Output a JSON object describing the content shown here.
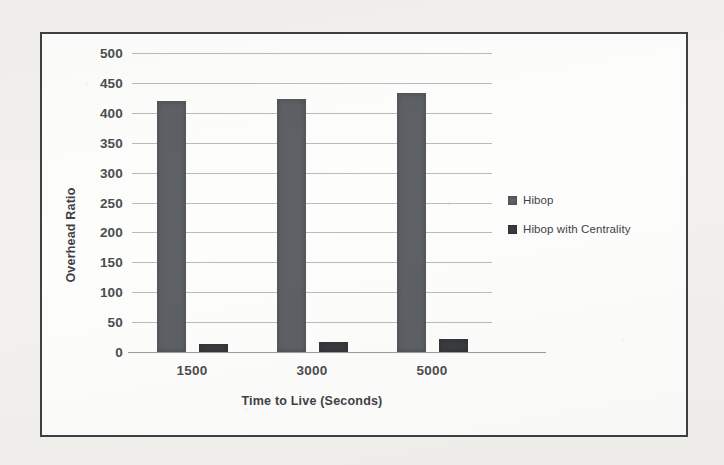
{
  "chart_data": {
    "type": "bar",
    "title": "",
    "xlabel": "Time to Live (Seconds)",
    "ylabel": "Overhead Ratio",
    "categories": [
      "1500",
      "3000",
      "5000"
    ],
    "series": [
      {
        "name": "Hibop",
        "values": [
          420,
          423,
          433
        ],
        "color": "#5d6064"
      },
      {
        "name": "Hibop with Centrality",
        "values": [
          14,
          17,
          21
        ],
        "color": "#3a3c3f"
      }
    ],
    "ylim": [
      0,
      500
    ],
    "ytick_labels": [
      "500",
      "450",
      "400",
      "350",
      "300",
      "250",
      "200",
      "150",
      "100",
      "50",
      "0"
    ],
    "ytick_values": [
      500,
      450,
      400,
      350,
      300,
      250,
      200,
      150,
      100,
      50,
      0
    ],
    "ytick_step": 50,
    "grid": true,
    "legend_position": "right",
    "legend": [
      "Hibop",
      "Hibop with Centrality"
    ]
  },
  "frame": {
    "border_color": "#3d4044",
    "background": "#fdfdfc",
    "page_background": "#f2f1ee"
  }
}
